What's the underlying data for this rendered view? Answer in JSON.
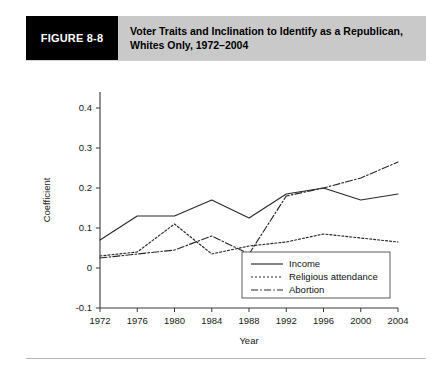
{
  "figure": {
    "tag": "FIGURE 8-8",
    "title": "Voter Traits and Inclination to Identify as a Republican, Whites Only, 1972–2004"
  },
  "chart_data": {
    "type": "line",
    "title": "",
    "xlabel": "Year",
    "ylabel": "Coefficient",
    "categories": [
      1972,
      1976,
      1980,
      1984,
      1988,
      1992,
      1996,
      2000,
      2004
    ],
    "xtick_labels": [
      "1972",
      "1976",
      "1980",
      "1984",
      "1988",
      "1992",
      "1996",
      "2000",
      "2004"
    ],
    "ytick_labels": [
      "-0.1",
      "0",
      "0.1",
      "0.2",
      "0.3",
      "0.4"
    ],
    "ytick_values": [
      -0.1,
      0,
      0.1,
      0.2,
      0.3,
      0.4
    ],
    "ylim": [
      -0.1,
      0.44
    ],
    "xlim": [
      1972,
      2004
    ],
    "grid": false,
    "legend_position": "bottom-right",
    "series": [
      {
        "name": "Income",
        "dash": "solid",
        "values": [
          0.07,
          0.13,
          0.13,
          0.17,
          0.125,
          0.185,
          0.2,
          0.17,
          0.185
        ]
      },
      {
        "name": "Religious attendance",
        "dash": "dotted",
        "values": [
          0.03,
          0.04,
          0.11,
          0.035,
          0.055,
          0.065,
          0.085,
          0.075,
          0.065
        ]
      },
      {
        "name": "Abortion",
        "dash": "dashdot",
        "values": [
          0.025,
          0.035,
          0.045,
          0.08,
          0.035,
          0.18,
          0.2,
          0.225,
          0.265
        ]
      }
    ]
  },
  "legend": {
    "items": [
      {
        "label": "Income"
      },
      {
        "label": "Religious attendance"
      },
      {
        "label": "Abortion"
      }
    ]
  }
}
